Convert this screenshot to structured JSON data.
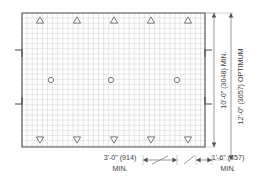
{
  "drawing": {
    "title": "Shelter Pad Plan Dimensions",
    "canvas": {
      "width": 267,
      "height": 182
    },
    "pad": {
      "name": "shelter-pad",
      "x": 22,
      "y": 13,
      "width": 183,
      "height": 134,
      "grid_spacing": 5.1
    },
    "notches": [
      {
        "side": "left",
        "x": 22,
        "y": 50
      },
      {
        "side": "left",
        "x": 22,
        "y": 104
      },
      {
        "side": "right",
        "x": 205,
        "y": 50
      },
      {
        "side": "right",
        "x": 205,
        "y": 104
      }
    ],
    "top_markers": {
      "name": "anchor-triangle-up",
      "symbol": "triangle-up",
      "count": 5,
      "y": 20,
      "xs": [
        40,
        77,
        114,
        151,
        188
      ]
    },
    "bottom_markers": {
      "name": "anchor-triangle-down",
      "symbol": "triangle-down",
      "count": 5,
      "y": 140,
      "xs": [
        40,
        77,
        114,
        151,
        188
      ]
    },
    "center_markers": {
      "name": "post-circle",
      "symbol": "circle",
      "count": 3,
      "y": 80,
      "xs": [
        51,
        111,
        177
      ],
      "radius": 2.6
    },
    "dimensions": {
      "vertical": [
        {
          "name": "height-minimum",
          "label": "10'-0\" (3048) MIN.",
          "feet_inches": "10'-0\"",
          "millimeters": "3048",
          "qualifier": "MIN.",
          "line_x": 214,
          "text_x": 226,
          "y_start": 13,
          "y_end": 147
        },
        {
          "name": "height-optimum",
          "label": "12'-0\" (3657) OPTIMUM",
          "feet_inches": "12'-0\"",
          "millimeters": "3657",
          "qualifier": "OPTIMUM",
          "line_x": 231,
          "text_x": 243,
          "y_start": 13,
          "y_end": 160
        }
      ],
      "horizontal": [
        {
          "name": "spacing-minimum-3ft",
          "label_main": "3'-0\" (914)",
          "label_sub": "MIN.",
          "feet_inches": "3'-0\"",
          "millimeters": "914",
          "qualifier": "MIN.",
          "text_x": 120,
          "text_y": 160,
          "sub_y": 171,
          "line_start": 143,
          "line_end": 177,
          "line_y": 160
        },
        {
          "name": "spacing-minimum-1ft6",
          "label_main": "1'-6\" (457)",
          "label_sub": "MIN.",
          "feet_inches": "1'-6\"",
          "millimeters": "457",
          "qualifier": "MIN.",
          "text_x": 228,
          "text_y": 160,
          "sub_y": 171,
          "line_start": 196,
          "line_end": 212,
          "line_y": 160
        }
      ]
    },
    "colors": {
      "background": "#ffffff",
      "outline": "#4a4a4a",
      "grid": "#c9c9c9",
      "symbol_stroke": "#555555",
      "dimension_line": "#555555",
      "text": "#3f3f3f"
    }
  }
}
